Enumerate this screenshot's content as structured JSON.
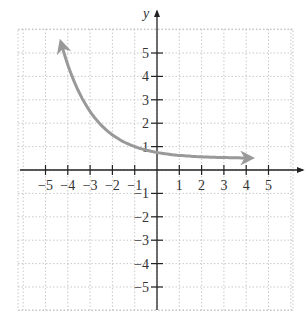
{
  "chart_data": {
    "type": "line",
    "title": "",
    "xlabel": "",
    "ylabel": "y",
    "xlim": [
      -6,
      6
    ],
    "ylim": [
      -6,
      6
    ],
    "grid": true,
    "x_ticks": [
      -5,
      -4,
      -3,
      -2,
      -1,
      1,
      2,
      3,
      4,
      5
    ],
    "y_ticks": [
      -5,
      -4,
      -3,
      -2,
      -1,
      1,
      2,
      3,
      4,
      5
    ],
    "x_tick_labels": [
      "−5",
      "−4",
      "−3",
      "−2",
      "−1",
      "1",
      "2",
      "3",
      "4",
      "5"
    ],
    "y_tick_labels": [
      "−5",
      "−4",
      "−3",
      "−2",
      "−1",
      "1",
      "2",
      "3",
      "4",
      "5"
    ],
    "series": [
      {
        "name": "curve",
        "description": "decreasing exponential with horizontal asymptote near y = 0.5, arrows on both ends",
        "color": "#999999",
        "x": [
          -4.3,
          -4,
          -3.5,
          -3,
          -2.5,
          -2,
          -1.5,
          -1,
          -0.5,
          0,
          0.5,
          1,
          1.5,
          2,
          2.5,
          3,
          3.5,
          4,
          4.2
        ],
        "y": [
          5.42,
          4.5,
          3.33,
          2.5,
          1.91,
          1.5,
          1.21,
          1.0,
          0.85,
          0.75,
          0.68,
          0.63,
          0.59,
          0.56,
          0.54,
          0.53,
          0.52,
          0.52,
          0.51
        ]
      }
    ]
  },
  "colors": {
    "axis": "#222222",
    "grid": "#bbbbbb",
    "curve": "#999999"
  }
}
